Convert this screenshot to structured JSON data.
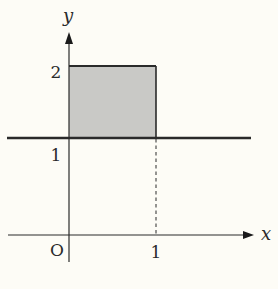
{
  "diagram": {
    "type": "coordinate-graph",
    "axes": {
      "x_label": "x",
      "y_label": "y",
      "origin_label": "O"
    },
    "tick_labels": {
      "x_one": "1",
      "y_one": "1",
      "y_two": "2"
    },
    "shaded_region": {
      "x_range": [
        0,
        1
      ],
      "y_range": [
        1,
        2
      ],
      "fill_color": "#c9c9c6"
    },
    "horizontal_line": {
      "y": 1,
      "style": "solid-thick"
    },
    "dashed_guide": {
      "x": 1,
      "y_range": [
        0,
        1
      ]
    },
    "colors": {
      "background": "#fdfcf6",
      "ink": "#2a2a2a"
    }
  }
}
